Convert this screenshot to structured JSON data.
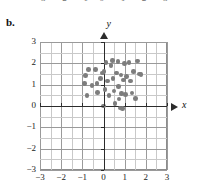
{
  "figure": {
    "panel_label": "b.",
    "clipped_tick_row": [
      "-3",
      "-2",
      "-1",
      "0",
      "1",
      "2",
      "3"
    ]
  },
  "axes": {
    "x_name": "x",
    "y_name": "y",
    "x_ticks": [
      "-3",
      "-2",
      "-1",
      "0",
      "1",
      "2",
      "3"
    ],
    "y_ticks": [
      "3",
      "2",
      "1",
      "0",
      "-1",
      "-2",
      "-3"
    ]
  },
  "colors": {
    "dot": "#7d7d7d",
    "axis": "#2b2b2b",
    "grid_minor": "#c9c9c9",
    "grid_major": "#9a9a9a",
    "frame": "#8c8c8c",
    "background": "#ffffff"
  },
  "chart_data": {
    "type": "scatter",
    "title": "",
    "xlabel": "x",
    "ylabel": "y",
    "xlim": [
      -3,
      3
    ],
    "ylim": [
      -3,
      3
    ],
    "grid": true,
    "grid_step": 0.5,
    "legend": "none",
    "series": [
      {
        "name": "data",
        "marker": "circle",
        "color": "#7d7d7d",
        "points": [
          [
            -0.72,
            1.7
          ],
          [
            -0.85,
            1.42
          ],
          [
            -0.9,
            1.05
          ],
          [
            -0.78,
            0.5
          ],
          [
            -0.55,
            0.95
          ],
          [
            -0.38,
            1.72
          ],
          [
            -0.3,
            1.05
          ],
          [
            -0.28,
            0.62
          ],
          [
            -0.15,
            1.28
          ],
          [
            -0.05,
            1.55
          ],
          [
            0.0,
            0.0
          ],
          [
            0.02,
            1.62
          ],
          [
            0.08,
            0.78
          ],
          [
            0.12,
            2.05
          ],
          [
            0.2,
            1.18
          ],
          [
            0.26,
            0.48
          ],
          [
            0.35,
            1.9
          ],
          [
            0.42,
            2.12
          ],
          [
            0.45,
            1.3
          ],
          [
            0.5,
            0.7
          ],
          [
            0.55,
            0.12
          ],
          [
            0.62,
            1.55
          ],
          [
            0.68,
            2.08
          ],
          [
            0.7,
            0.92
          ],
          [
            0.74,
            0.32
          ],
          [
            0.78,
            -0.1
          ],
          [
            0.82,
            1.45
          ],
          [
            0.86,
            0.58
          ],
          [
            0.9,
            -0.12
          ],
          [
            0.95,
            1.22
          ],
          [
            1.0,
            1.98
          ],
          [
            1.05,
            0.55
          ],
          [
            1.1,
            1.38
          ],
          [
            1.2,
            2.05
          ],
          [
            1.28,
            1.18
          ],
          [
            1.35,
            0.6
          ],
          [
            1.42,
            1.62
          ],
          [
            1.52,
            0.35
          ],
          [
            1.62,
            2.1
          ],
          [
            1.7,
            1.5
          ],
          [
            1.78,
            1.48
          ]
        ]
      }
    ]
  }
}
